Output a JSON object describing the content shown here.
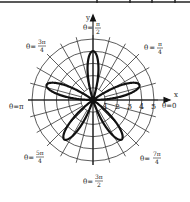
{
  "chart_data": {
    "type": "line",
    "subtype": "polar",
    "title": "",
    "equation": "r = 4 sin 5θ",
    "curve": {
      "amplitude": 4,
      "k": 5,
      "function": "sin"
    },
    "petal_angles_deg": [
      18,
      90,
      162,
      234,
      306
    ],
    "petal_length": 4,
    "radial_ticks": [
      "1",
      "2",
      "3",
      "4",
      "5"
    ],
    "r_max": 5,
    "grid": {
      "rings": 5,
      "spoke_step_deg": 15
    },
    "axes": {
      "x_label": "x",
      "y_label": "y"
    },
    "angle_labels": [
      {
        "id": "a0",
        "text": "θ = 0"
      },
      {
        "id": "a45",
        "text": "θ = π/4"
      },
      {
        "id": "a90",
        "text": "θ = π/2"
      },
      {
        "id": "a135",
        "text": "θ = 3π/4"
      },
      {
        "id": "a180",
        "text": "θ = π"
      },
      {
        "id": "a225",
        "text": "θ = 5π/4"
      },
      {
        "id": "a270",
        "text": "θ = 3π/2"
      },
      {
        "id": "a315",
        "text": "θ = 7π/4"
      }
    ]
  },
  "colors": {
    "curve": "#111111",
    "grid": "#333333",
    "text": "#222222",
    "background": "#ffffff"
  },
  "labels": {
    "x": "x",
    "y": "y",
    "theta": "θ",
    "eq": "=",
    "a0": "0",
    "a45_num": "π",
    "a45_den": "4",
    "a90_num": "π",
    "a90_den": "2",
    "a135_num": "3π",
    "a135_den": "4",
    "a180": "π",
    "a225_num": "5π",
    "a225_den": "4",
    "a270_num": "3π",
    "a270_den": "2",
    "a315_num": "7π",
    "a315_den": "4",
    "t1": "1",
    "t2": "2",
    "t3": "3",
    "t4": "4",
    "t5": "5"
  }
}
